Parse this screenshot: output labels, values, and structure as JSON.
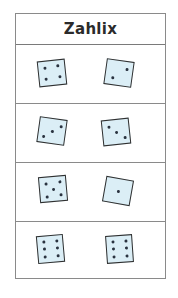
{
  "header": {
    "title": "Zahlix"
  },
  "colors": {
    "die_fill": "#dbeef6",
    "die_border": "#2f2f2f",
    "pip": "#2a3340",
    "grid": "#8a8a8a"
  },
  "rows": [
    {
      "left": {
        "pips": 4,
        "rotate": -6
      },
      "right": {
        "pips": 2,
        "rotate": 8
      }
    },
    {
      "left": {
        "pips": 3,
        "rotate": 8
      },
      "right": {
        "pips": 3,
        "rotate": -6
      }
    },
    {
      "left": {
        "pips": 5,
        "rotate": -5
      },
      "right": {
        "pips": 1,
        "rotate": 10
      }
    },
    {
      "left": {
        "pips": 6,
        "rotate": -5
      },
      "right": {
        "pips": 6,
        "rotate": -4
      }
    }
  ]
}
